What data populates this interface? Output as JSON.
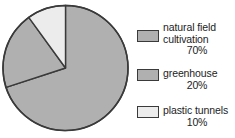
{
  "chart_data": {
    "type": "pie",
    "title": "",
    "labels": [
      "natural field cultivation",
      "greenhouse",
      "plastic tunnels"
    ],
    "values": [
      70,
      20,
      10
    ],
    "value_labels": [
      "70%",
      "20%",
      "10%"
    ],
    "units": "percent",
    "start_angle_deg": 0,
    "direction": "clockwise",
    "legend_position": "right",
    "grid": false,
    "colors": [
      "#b0b0b0",
      "#b0b0b0",
      "#ececec"
    ],
    "outline_color": "#3a3a3a",
    "slices": [
      {
        "label": "natural field cultivation",
        "value": 70,
        "value_label": "70%",
        "color": "#b0b0b0",
        "start_deg": 0,
        "end_deg": 252
      },
      {
        "label": "greenhouse",
        "value": 20,
        "value_label": "20%",
        "color": "#b0b0b0",
        "start_deg": 252,
        "end_deg": 324
      },
      {
        "label": "plastic tunnels",
        "value": 10,
        "value_label": "10%",
        "color": "#ececec",
        "start_deg": 324,
        "end_deg": 360
      }
    ]
  },
  "legend": {
    "items": [
      {
        "label_line1": "natural field",
        "label_line2": "cultivation",
        "value": "70%",
        "color": "#b0b0b0"
      },
      {
        "label_line1": "greenhouse",
        "label_line2": "",
        "value": "20%",
        "color": "#b0b0b0"
      },
      {
        "label_line1": "plastic tunnels",
        "label_line2": "",
        "value": "10%",
        "color": "#ececec"
      }
    ]
  }
}
